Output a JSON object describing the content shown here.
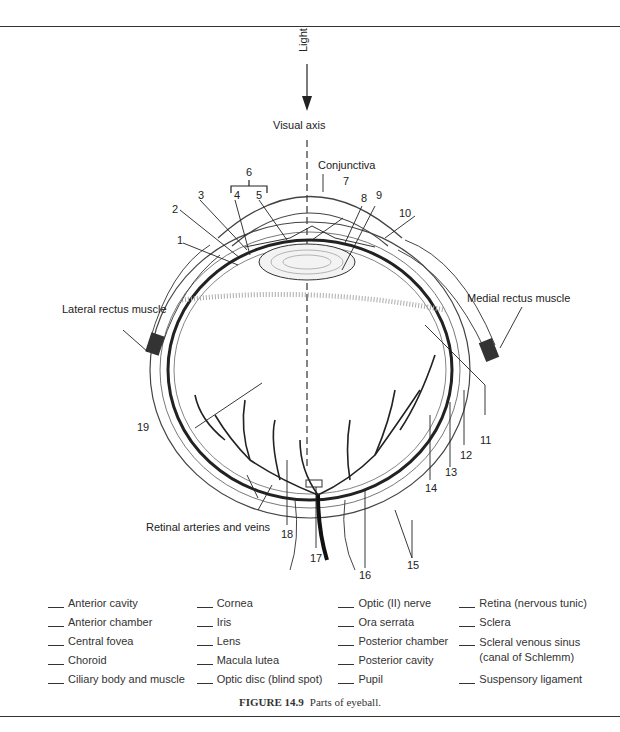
{
  "figure": {
    "number": "FIGURE 14.9",
    "title": "Parts of eyeball."
  },
  "diagram_labels": {
    "light": "Light",
    "visual_axis": "Visual axis",
    "conjunctiva": "Conjunctiva",
    "lateral_rectus": "Lateral rectus muscle",
    "medial_rectus": "Medial rectus muscle",
    "retinal_vessels": "Retinal arteries and veins"
  },
  "numbers": [
    "1",
    "2",
    "3",
    "4",
    "5",
    "6",
    "7",
    "8",
    "9",
    "10",
    "11",
    "12",
    "13",
    "14",
    "15",
    "16",
    "17",
    "18",
    "19"
  ],
  "legend": {
    "columns": [
      [
        "Anterior cavity",
        "Anterior chamber",
        "Central fovea",
        "Choroid",
        "Ciliary body and muscle"
      ],
      [
        "Cornea",
        "Iris",
        "Lens",
        "Macula lutea",
        "Optic disc (blind spot)"
      ],
      [
        "Optic (II) nerve",
        "Ora serrata",
        "Posterior chamber",
        "Posterior cavity",
        "Pupil"
      ],
      [
        "Retina (nervous tunic)",
        "Sclera",
        "Scleral venous sinus (canal of Schlemm)",
        "Suspensory ligament"
      ]
    ]
  }
}
